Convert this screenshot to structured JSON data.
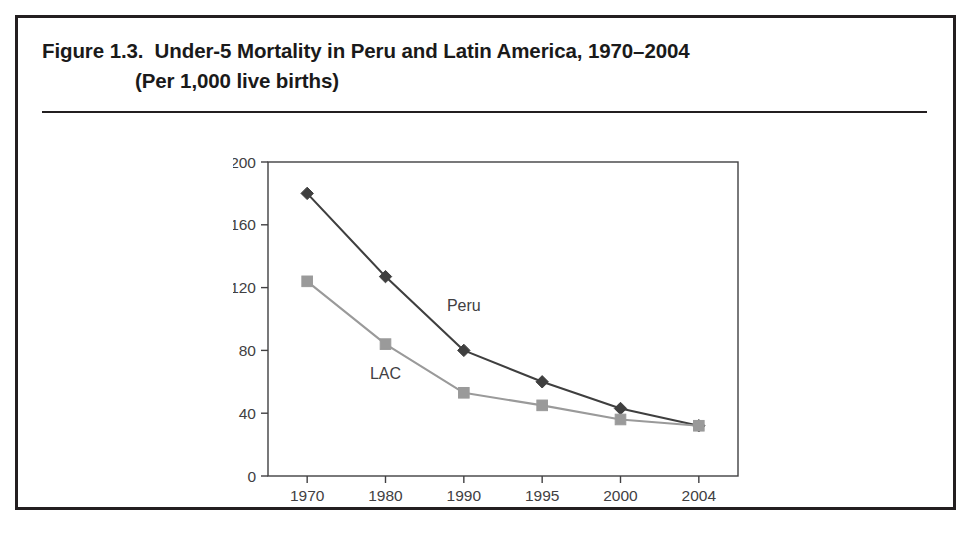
{
  "figure": {
    "title_line_1": "Figure 1.3.  Under-5 Mortality in Peru and Latin America, 1970–2004",
    "title_line_2": "(Per 1,000 live births)"
  },
  "chart_data": {
    "type": "line",
    "title": "Under-5 Mortality in Peru and Latin America, 1970–2004",
    "subtitle": "(Per 1,000 live births)",
    "xlabel": "",
    "ylabel": "",
    "categories": [
      "1970",
      "1980",
      "1990",
      "1995",
      "2000",
      "2004"
    ],
    "x_tick_labels": [
      "1970",
      "1980",
      "1990",
      "1995",
      "2000",
      "2004"
    ],
    "y_tick_labels": [
      "0",
      "40",
      "80",
      "120",
      "160",
      "200"
    ],
    "y_ticks": [
      0,
      40,
      80,
      120,
      160,
      200
    ],
    "ylim": [
      0,
      200
    ],
    "grid": false,
    "legend": "inline-annotations",
    "series": [
      {
        "name": "Peru",
        "label": "Peru",
        "color": "#3f3f3f",
        "marker": "diamond",
        "values": [
          180,
          127,
          80,
          60,
          43,
          32
        ]
      },
      {
        "name": "LAC",
        "label": "LAC",
        "color": "#9a9a9a",
        "marker": "square",
        "values": [
          124,
          84,
          53,
          45,
          36,
          32
        ]
      }
    ],
    "annotations": [
      {
        "text": "Peru",
        "x": "1990",
        "y": 105
      },
      {
        "text": "LAC",
        "x": "1980",
        "y": 62
      }
    ]
  },
  "colors": {
    "frame": "#231f20",
    "axis": "#414042",
    "peru_line": "#3f3f3f",
    "lac_line": "#9a9a9a",
    "background": "#ffffff"
  }
}
